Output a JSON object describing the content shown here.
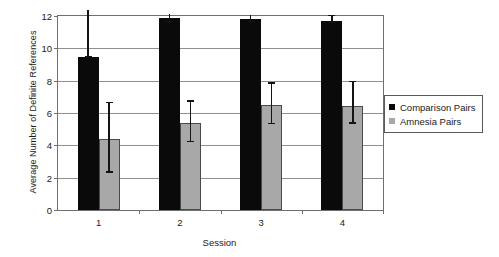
{
  "chart_data": {
    "type": "bar",
    "title": "",
    "xlabel": "Session",
    "ylabel": "Average Number of Definite References",
    "categories": [
      "1",
      "2",
      "3",
      "4"
    ],
    "ylim": [
      0,
      12
    ],
    "yticks": [
      0,
      2,
      4,
      6,
      8,
      10,
      12
    ],
    "ytick_labels": [
      "0",
      "2",
      "4",
      "6",
      "8",
      "10",
      "12"
    ],
    "grid": "horizontal",
    "legend_position": "right",
    "series": [
      {
        "name": "Comparison Pairs",
        "color": "#0a0a0a",
        "values": [
          9.45,
          11.85,
          11.8,
          11.7
        ],
        "error_low": [
          9.45,
          11.6,
          11.6,
          11.55
        ],
        "error_high": [
          12.6,
          12.1,
          12.05,
          12.0
        ]
      },
      {
        "name": "Amnesia Pairs",
        "color": "#a8a8a8",
        "values": [
          4.4,
          5.4,
          6.5,
          6.45
        ],
        "error_low": [
          2.3,
          4.2,
          5.3,
          5.35
        ],
        "error_high": [
          6.6,
          6.7,
          7.8,
          7.9
        ]
      }
    ]
  },
  "legend": {
    "items": [
      {
        "label": "Comparison Pairs",
        "swatch": "#0a0a0a"
      },
      {
        "label": "Amnesia Pairs",
        "swatch": "#a8a8a8"
      }
    ]
  },
  "axes": {
    "x_title": "Session",
    "y_title": "Average Number of Definite References"
  }
}
